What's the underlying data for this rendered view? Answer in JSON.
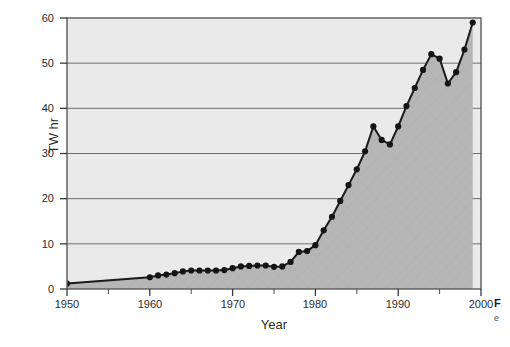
{
  "figure": {
    "caption_fragment": "F",
    "caption_fragment_sub": "e"
  },
  "chart_data": {
    "type": "area",
    "title": "",
    "subtitle": "",
    "xlabel": "Year",
    "ylabel": "TW hr",
    "xlim": [
      1950,
      2000
    ],
    "ylim": [
      0,
      60
    ],
    "xticks": [
      1950,
      1960,
      1970,
      1980,
      1990,
      2000
    ],
    "xtick_labels": [
      "1950",
      "1960",
      "1970",
      "1980",
      "1990",
      "2000"
    ],
    "yticks": [
      0,
      10,
      20,
      30,
      40,
      50,
      60
    ],
    "ytick_labels": [
      "0",
      "10",
      "20",
      "30",
      "40",
      "50",
      "60"
    ],
    "xminor_ticks": [
      1955,
      1965,
      1975,
      1985,
      1995
    ],
    "grid": "horizontal",
    "legend": null,
    "legend_position": "none",
    "annotations": [],
    "colors": {
      "plot_background": "#eaeaea",
      "area_fill": "#b4b4b4",
      "line": "#1a1a1a",
      "marker": "#1a1a1a",
      "gridline": "#6e6e6e",
      "frame": "#5a5a5a",
      "page_background": "#ffffff"
    },
    "marker_style": "filled-circle",
    "marker_note": "No markers between 1950 and 1960; straight segment joins the two endpoints.",
    "series": [
      {
        "name": "TW hr",
        "x": [
          1950,
          1960,
          1961,
          1962,
          1963,
          1964,
          1965,
          1966,
          1967,
          1968,
          1969,
          1970,
          1971,
          1972,
          1973,
          1974,
          1975,
          1976,
          1977,
          1978,
          1979,
          1980,
          1981,
          1982,
          1983,
          1984,
          1985,
          1986,
          1987,
          1988,
          1989,
          1990,
          1991,
          1992,
          1993,
          1994,
          1995,
          1996,
          1997,
          1998,
          1999
        ],
        "values": [
          1.2,
          2.6,
          3.0,
          3.2,
          3.5,
          3.9,
          4.1,
          4.1,
          4.1,
          4.1,
          4.2,
          4.6,
          5.0,
          5.1,
          5.2,
          5.2,
          4.9,
          5.0,
          6.0,
          8.2,
          8.4,
          9.7,
          13.0,
          16.0,
          19.5,
          23.0,
          26.5,
          30.5,
          36.0,
          33.0,
          32.0,
          36.0,
          40.5,
          44.5,
          48.5,
          52.0,
          51.0,
          45.5,
          48.0,
          53.0,
          59.0
        ]
      }
    ]
  }
}
